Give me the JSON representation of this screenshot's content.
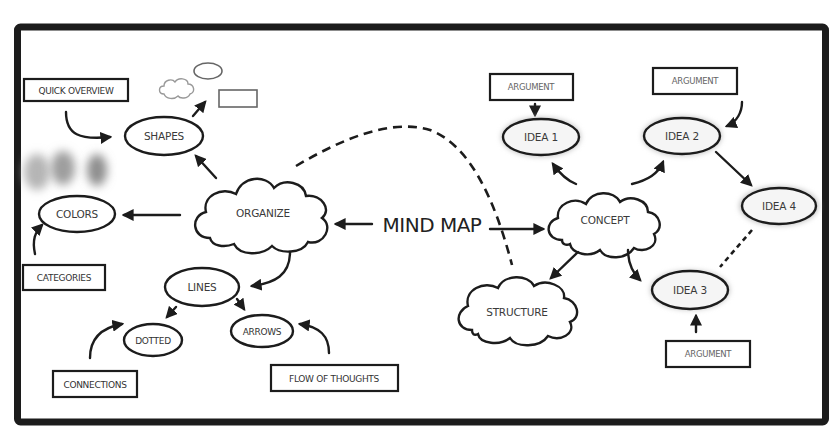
{
  "diagram": {
    "title": "MIND MAP",
    "colors": {
      "frame": "#1c1c1c",
      "background": "#ffffff",
      "idea_glow": "#bdbdbd",
      "blob": "#9a9a9a"
    },
    "left_branch": {
      "hub": "ORGANIZE",
      "nodes": {
        "shapes": "SHAPES",
        "colors": "COLORS",
        "lines": "LINES",
        "dotted": "DOTTED",
        "arrows": "ARROWS"
      },
      "labels": {
        "quick_overview": "QUICK OVERVIEW",
        "categories": "CATEGORIES",
        "connections": "CONNECTIONS",
        "flow_of_thoughts": "FLOW OF THOUGHTS"
      }
    },
    "right_branch": {
      "hub": "CONCEPT",
      "structure": "STRUCTURE",
      "ideas": [
        "IDEA 1",
        "IDEA 2",
        "IDEA 3",
        "IDEA 4"
      ],
      "arguments": [
        "ARGUMENT",
        "ARGUMENT",
        "ARGUMENT"
      ]
    },
    "icons": [
      "cloud-outline-icon",
      "ellipse-outline-icon",
      "rectangle-outline-icon",
      "color-blob-icon"
    ]
  }
}
